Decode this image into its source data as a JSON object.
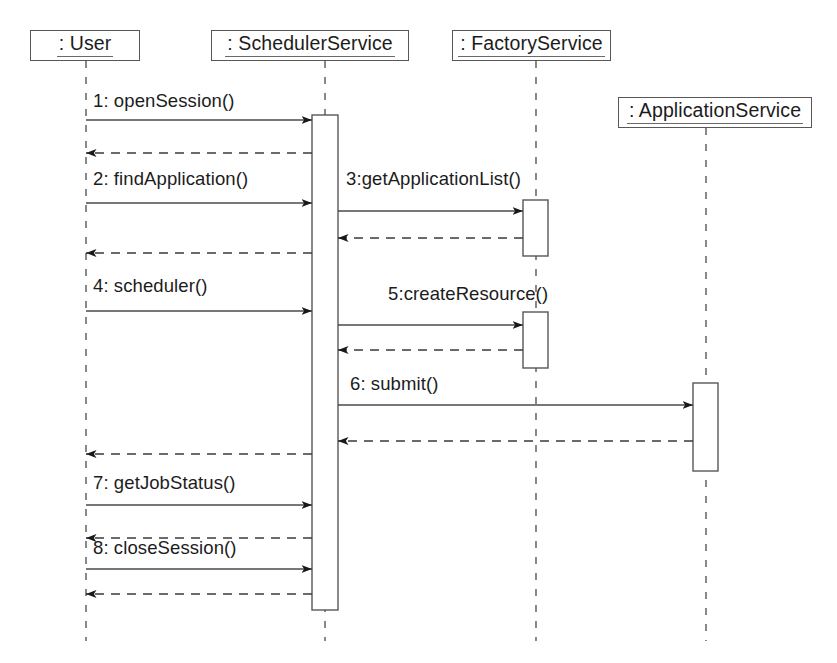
{
  "diagram": {
    "type": "uml-sequence-diagram",
    "width": 837,
    "height": 663,
    "background_color": "#ffffff",
    "line_color": "#575757",
    "text_color": "#1c1c1c"
  },
  "lifelines": [
    {
      "id": "user",
      "label": ": User",
      "box": {
        "x": 30,
        "y": 30,
        "w": 110,
        "h": 31
      },
      "axis_x": 86,
      "line_top": 61,
      "line_bottom": 641
    },
    {
      "id": "scheduler",
      "label": ": SchedulerService",
      "box": {
        "x": 211,
        "y": 30,
        "w": 198,
        "h": 31
      },
      "axis_x": 325,
      "line_top": 61,
      "line_bottom": 641
    },
    {
      "id": "factory",
      "label": ": FactoryService",
      "box": {
        "x": 452,
        "y": 30,
        "w": 159,
        "h": 31
      },
      "axis_x": 536,
      "line_top": 61,
      "line_bottom": 641
    },
    {
      "id": "application",
      "label": ": ApplicationService",
      "box": {
        "x": 618,
        "y": 97,
        "w": 194,
        "h": 31
      },
      "axis_x": 706,
      "line_top": 128,
      "line_bottom": 641
    }
  ],
  "activations": [
    {
      "id": "act-scheduler",
      "lifeline": "scheduler",
      "x": 312,
      "y": 115,
      "w": 26,
      "h": 495
    },
    {
      "id": "act-factory-1",
      "lifeline": "factory",
      "x": 523,
      "y": 200,
      "w": 25,
      "h": 56
    },
    {
      "id": "act-factory-2",
      "lifeline": "factory",
      "x": 523,
      "y": 312,
      "w": 25,
      "h": 56
    },
    {
      "id": "act-application",
      "lifeline": "application",
      "x": 693,
      "y": 383,
      "w": 25,
      "h": 88
    }
  ],
  "messages": [
    {
      "seq": "1",
      "label": "1: openSession()",
      "kind": "call",
      "from_x": 86,
      "to_x": 312,
      "y": 120,
      "label_x": 93,
      "label_y": 92
    },
    {
      "seq": "1r",
      "label": "",
      "kind": "return",
      "from_x": 312,
      "to_x": 86,
      "y": 153,
      "label_x": 0,
      "label_y": 0
    },
    {
      "seq": "2",
      "label": "2: findApplication()",
      "kind": "call",
      "from_x": 86,
      "to_x": 312,
      "y": 203,
      "label_x": 93,
      "label_y": 170
    },
    {
      "seq": "3",
      "label": "3:getApplicationList()",
      "kind": "call",
      "from_x": 338,
      "to_x": 523,
      "y": 211,
      "label_x": 346,
      "label_y": 170
    },
    {
      "seq": "3r",
      "label": "",
      "kind": "return",
      "from_x": 523,
      "to_x": 338,
      "y": 238,
      "label_x": 0,
      "label_y": 0
    },
    {
      "seq": "2r",
      "label": "",
      "kind": "return",
      "from_x": 312,
      "to_x": 86,
      "y": 253,
      "label_x": 0,
      "label_y": 0
    },
    {
      "seq": "4",
      "label": "4: scheduler()",
      "kind": "call",
      "from_x": 86,
      "to_x": 312,
      "y": 311,
      "label_x": 93,
      "label_y": 277
    },
    {
      "seq": "5",
      "label": "5:createResource()",
      "kind": "call",
      "from_x": 338,
      "to_x": 523,
      "y": 325,
      "label_x": 388,
      "label_y": 285
    },
    {
      "seq": "5r",
      "label": "",
      "kind": "return",
      "from_x": 523,
      "to_x": 338,
      "y": 350,
      "label_x": 0,
      "label_y": 0
    },
    {
      "seq": "6",
      "label": "6: submit()",
      "kind": "call",
      "from_x": 338,
      "to_x": 693,
      "y": 405,
      "label_x": 350,
      "label_y": 375
    },
    {
      "seq": "6r",
      "label": "",
      "kind": "return",
      "from_x": 693,
      "to_x": 338,
      "y": 441,
      "label_x": 0,
      "label_y": 0
    },
    {
      "seq": "6u",
      "label": "",
      "kind": "return",
      "from_x": 312,
      "to_x": 86,
      "y": 454,
      "label_x": 0,
      "label_y": 0
    },
    {
      "seq": "7",
      "label": "7: getJobStatus()",
      "kind": "call",
      "from_x": 86,
      "to_x": 312,
      "y": 505,
      "label_x": 93,
      "label_y": 474
    },
    {
      "seq": "7r",
      "label": "",
      "kind": "return",
      "from_x": 312,
      "to_x": 86,
      "y": 538,
      "label_x": 0,
      "label_y": 0
    },
    {
      "seq": "8",
      "label": "8: closeSession()",
      "kind": "call",
      "from_x": 86,
      "to_x": 312,
      "y": 569,
      "label_x": 93,
      "label_y": 539
    },
    {
      "seq": "8r",
      "label": "",
      "kind": "return",
      "from_x": 312,
      "to_x": 86,
      "y": 594,
      "label_x": 0,
      "label_y": 0
    }
  ]
}
